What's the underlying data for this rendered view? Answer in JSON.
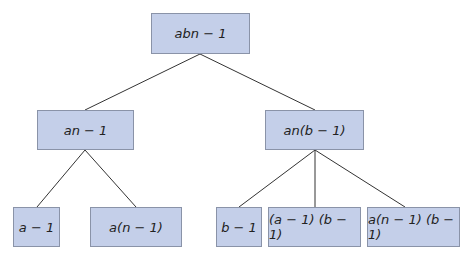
{
  "diagram": {
    "type": "tree",
    "nodes": {
      "root": {
        "label": "abn − 1"
      },
      "left": {
        "label": "an − 1"
      },
      "right": {
        "label": "an(b − 1)"
      },
      "ll": {
        "label": "a − 1"
      },
      "lr": {
        "label": "a(n − 1)"
      },
      "rl": {
        "label": "b − 1"
      },
      "rm": {
        "label": "(a − 1) (b − 1)"
      },
      "rr": {
        "label": "a(n − 1) (b − 1)"
      }
    },
    "edges": [
      [
        "root",
        "left"
      ],
      [
        "root",
        "right"
      ],
      [
        "left",
        "ll"
      ],
      [
        "left",
        "lr"
      ],
      [
        "right",
        "rl"
      ],
      [
        "right",
        "rm"
      ],
      [
        "right",
        "rr"
      ]
    ],
    "colors": {
      "node_fill": "#c4cfe9",
      "node_border": "#8a93a8",
      "line": "#333333"
    }
  }
}
